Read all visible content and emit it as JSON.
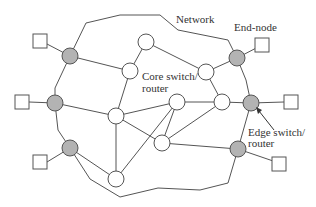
{
  "diagram": {
    "type": "network-topology",
    "labels": {
      "network": "Network",
      "end_node": "End-node",
      "core_line1": "Core switch/",
      "core_line2": "router",
      "edge_line1": "Edge switch/",
      "edge_line2": "router"
    },
    "colors": {
      "edge_node_fill": "#b3b3b3",
      "core_node_fill": "#ffffff",
      "stroke": "#555555",
      "text": "#333333"
    },
    "legend": {
      "end_node": "square",
      "edge_switch_router": "gray circle",
      "core_switch_router": "white circle"
    },
    "counts": {
      "end_nodes": 6,
      "edge_switches": 6,
      "core_switches": 8
    }
  }
}
